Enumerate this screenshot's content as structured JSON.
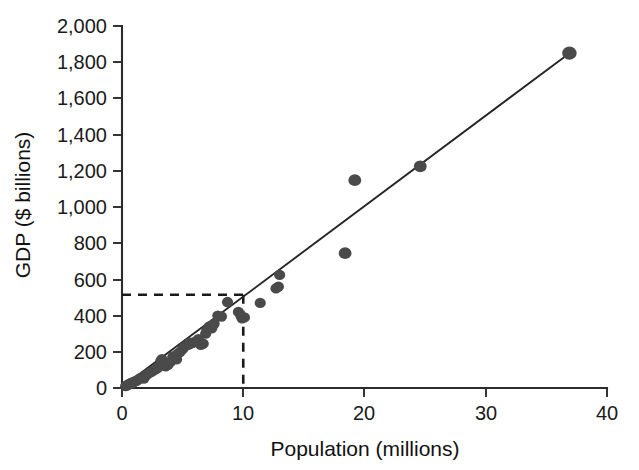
{
  "chart_data": {
    "type": "scatter",
    "title": "",
    "xlabel": "Population (millions)",
    "ylabel": "GDP ($ billions)",
    "xlim": [
      0,
      40
    ],
    "ylim": [
      0,
      2000
    ],
    "xticks": [
      0,
      10,
      20,
      30,
      40
    ],
    "xtick_labels": [
      "0",
      "10",
      "20",
      "30",
      "40"
    ],
    "yticks": [
      0,
      200,
      400,
      600,
      800,
      1000,
      1200,
      1400,
      1600,
      1800,
      2000
    ],
    "ytick_labels": [
      "0",
      "200",
      "400",
      "600",
      "800",
      "1,000",
      "1,200",
      "1,400",
      "1,600",
      "1,800",
      "2,000"
    ],
    "grid": false,
    "legend": null,
    "marker_color": "#4a4a4a",
    "line_color": "#262626",
    "series": [
      {
        "name": "Countries",
        "type": "scatter",
        "points": [
          [
            0.3,
            10
          ],
          [
            0.4,
            15
          ],
          [
            0.5,
            18
          ],
          [
            0.6,
            22
          ],
          [
            0.7,
            25
          ],
          [
            0.8,
            30
          ],
          [
            0.9,
            28
          ],
          [
            1.0,
            35
          ],
          [
            1.2,
            40
          ],
          [
            1.3,
            45
          ],
          [
            1.5,
            55
          ],
          [
            1.7,
            60
          ],
          [
            1.8,
            52
          ],
          [
            2.0,
            70
          ],
          [
            2.1,
            78
          ],
          [
            2.3,
            85
          ],
          [
            2.5,
            92
          ],
          [
            2.7,
            100
          ],
          [
            2.9,
            108
          ],
          [
            3.0,
            115
          ],
          [
            3.2,
            150
          ],
          [
            3.3,
            160
          ],
          [
            3.5,
            135
          ],
          [
            3.6,
            120
          ],
          [
            3.8,
            128
          ],
          [
            4.0,
            145
          ],
          [
            4.2,
            175
          ],
          [
            4.3,
            165
          ],
          [
            4.5,
            158
          ],
          [
            4.6,
            190
          ],
          [
            4.8,
            200
          ],
          [
            5.0,
            215
          ],
          [
            5.1,
            225
          ],
          [
            5.3,
            235
          ],
          [
            5.5,
            240
          ],
          [
            5.6,
            250
          ],
          [
            5.8,
            248
          ],
          [
            6.0,
            255
          ],
          [
            6.2,
            262
          ],
          [
            6.3,
            270
          ],
          [
            6.5,
            238
          ],
          [
            6.7,
            245
          ],
          [
            6.9,
            300
          ],
          [
            7.0,
            320
          ],
          [
            7.2,
            340
          ],
          [
            7.4,
            330
          ],
          [
            7.6,
            355
          ],
          [
            7.9,
            400
          ],
          [
            8.2,
            395
          ],
          [
            8.7,
            475
          ],
          [
            9.6,
            420
          ],
          [
            9.8,
            400
          ],
          [
            9.9,
            385
          ],
          [
            10.1,
            390
          ],
          [
            11.4,
            470
          ],
          [
            12.7,
            550
          ],
          [
            12.9,
            560
          ],
          [
            13.0,
            625
          ],
          [
            18.4,
            745
          ],
          [
            19.2,
            1148
          ],
          [
            24.6,
            1225
          ],
          [
            36.9,
            1850
          ]
        ]
      }
    ],
    "trend_line": {
      "name": "Linear fit",
      "type": "line",
      "x_start": 0.0,
      "y_start": 5,
      "x_end": 36.9,
      "y_end": 1850
    },
    "reference_lines": {
      "horizontal": {
        "label": "predicted GDP at population 10",
        "y_value": 515,
        "x_from": 0,
        "x_to": 10
      },
      "vertical": {
        "label": "population reference",
        "x_value": 10,
        "y_from": 0,
        "y_to": 515
      }
    },
    "annotations": []
  }
}
